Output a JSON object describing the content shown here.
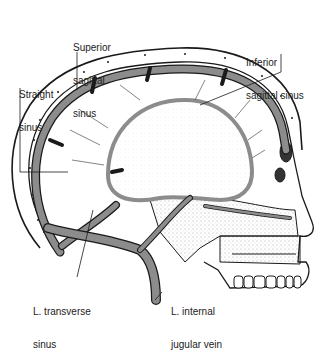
{
  "figure": {
    "colors": {
      "sinus_fill": "#8c8c8c",
      "outline": "#1a1a1a",
      "bone_fill": "#ffffff",
      "background": "#ffffff"
    },
    "labels": [
      {
        "id": "superior-sagittal-sinus",
        "lines": [
          "Superior",
          "sagittal",
          "sinus"
        ]
      },
      {
        "id": "inferior-sagittal-sinus",
        "lines": [
          "Inferior",
          "sagittal sinus"
        ]
      },
      {
        "id": "straight-sinus",
        "lines": [
          "Straight",
          "sinus"
        ]
      },
      {
        "id": "l-transverse-sinus",
        "lines": [
          "L. transverse",
          "sinus"
        ]
      },
      {
        "id": "l-internal-jugular-vein",
        "lines": [
          "L. internal",
          "jugular vein"
        ]
      }
    ]
  }
}
